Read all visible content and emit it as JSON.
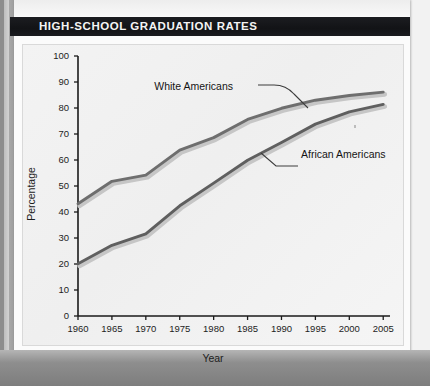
{
  "banner": {
    "title": "HIGH-SCHOOL GRADUATION RATES"
  },
  "colors": {
    "banner_bg": "#15161a",
    "banner_text": "#f4f4f4",
    "plot_bg": "#f2f2f2",
    "axis": "#1a1a1a",
    "line_white_americans": "#6e6e6e",
    "line_african_americans": "#5f5f5f",
    "page": "#fbfbfb"
  },
  "chart_data": {
    "type": "line",
    "title": "HIGH-SCHOOL GRADUATION RATES",
    "xlabel": "Year",
    "ylabel": "Percentage",
    "x": [
      1960,
      1965,
      1970,
      1975,
      1980,
      1985,
      1990,
      1995,
      2000,
      2005
    ],
    "categories": [
      "1960",
      "1965",
      "1970",
      "1975",
      "1980",
      "1985",
      "1990",
      "1995",
      "2000",
      "2005"
    ],
    "xlim": [
      1960,
      2006
    ],
    "ylim": [
      0,
      100
    ],
    "ytick_values": [
      0,
      10,
      20,
      30,
      40,
      50,
      60,
      70,
      80,
      90,
      100
    ],
    "ytick_labels": [
      "0",
      "10",
      "20",
      "30",
      "40",
      "50",
      "60",
      "70",
      "80",
      "90",
      "100"
    ],
    "grid": false,
    "legend_position": "inline-annotations",
    "series": [
      {
        "name": "White Americans",
        "values": [
          43.2,
          51.8,
          54.2,
          63.8,
          68.6,
          75.6,
          79.9,
          83.0,
          84.8,
          86.1
        ]
      },
      {
        "name": "African Americans",
        "values": [
          20.1,
          27.2,
          31.6,
          42.4,
          51.1,
          59.9,
          66.7,
          73.8,
          78.5,
          81.4
        ]
      }
    ],
    "annotations": [
      {
        "text": "White Americans",
        "target_series": "White Americans",
        "target_x": 1992
      },
      {
        "text": "African Americans",
        "target_series": "African Americans",
        "target_x": 1989
      }
    ]
  },
  "axis": {
    "y_ticks": [
      "100",
      "90",
      "80",
      "70",
      "60",
      "50",
      "40",
      "30",
      "20",
      "10",
      "0"
    ],
    "x_ticks": [
      "1960",
      "1965",
      "1970",
      "1975",
      "1980",
      "1985",
      "1990",
      "1995",
      "2000",
      "2005"
    ],
    "y_title": "Percentage",
    "x_title": "Year"
  },
  "annotations": {
    "white_label": "White Americans",
    "african_label": "African Americans"
  }
}
